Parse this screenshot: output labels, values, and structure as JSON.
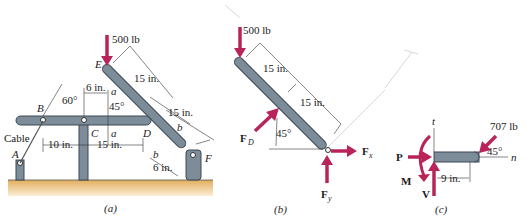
{
  "figure": {
    "panels": [
      {
        "id": "a",
        "caption": "(a)",
        "load": "500 lb",
        "points": {
          "A": "A",
          "B": "B",
          "C": "C",
          "D": "D",
          "E": "E",
          "F": "F"
        },
        "cable_label": "Cable",
        "angles": {
          "cable": "60°",
          "member": "45°"
        },
        "dims": {
          "bc": "10 in.",
          "cd": "15 in.",
          "c_a": "6 in.",
          "ed": "15 in.",
          "df": "15 in.",
          "bf": "6 in."
        },
        "section_labels": {
          "a_top": "a",
          "a_bottom": "a",
          "b_top": "b",
          "b_bottom": "b"
        }
      },
      {
        "id": "b",
        "caption": "(b)",
        "load": "500 lb",
        "dims": {
          "upper": "15 in.",
          "lower": "15 in."
        },
        "angle": "45°",
        "forces": {
          "FD": "F",
          "FD_sub": "D",
          "Fx": "F",
          "Fx_sub": "x",
          "Fy": "F",
          "Fy_sub": "y"
        }
      },
      {
        "id": "c",
        "caption": "(c)",
        "load": "707 lb",
        "angle": "45°",
        "dim": "9 in.",
        "axes": {
          "t": "t",
          "n": "n"
        },
        "forces": {
          "P": "P",
          "M": "M",
          "V": "V"
        }
      }
    ],
    "colors": {
      "member": "#7d8c99",
      "force": "#b8245a",
      "ground": "#e8b86a"
    }
  }
}
